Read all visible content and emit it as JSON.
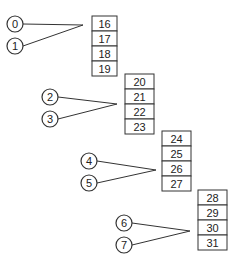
{
  "diagram": {
    "stroke_color": "#333333",
    "background": "#ffffff",
    "groups": [
      {
        "inputs": [
          {
            "label": "0",
            "cx": 15,
            "cy": 24
          },
          {
            "label": "1",
            "cx": 15,
            "cy": 46
          }
        ],
        "converge": {
          "x": 83,
          "y": 25
        },
        "box": {
          "x": 92,
          "y": 16,
          "w": 25,
          "cell_h": 15
        },
        "cells": [
          "16",
          "17",
          "18",
          "19"
        ]
      },
      {
        "inputs": [
          {
            "label": "2",
            "cx": 50,
            "cy": 97
          },
          {
            "label": "3",
            "cx": 50,
            "cy": 119
          }
        ],
        "converge": {
          "x": 117,
          "y": 104
        },
        "box": {
          "x": 125,
          "y": 74,
          "w": 29,
          "cell_h": 15
        },
        "cells": [
          "20",
          "21",
          "22",
          "23"
        ]
      },
      {
        "inputs": [
          {
            "label": "4",
            "cx": 89,
            "cy": 161
          },
          {
            "label": "5",
            "cx": 89,
            "cy": 183
          }
        ],
        "converge": {
          "x": 156,
          "y": 170
        },
        "box": {
          "x": 162,
          "y": 131,
          "w": 29,
          "cell_h": 15
        },
        "cells": [
          "24",
          "25",
          "26",
          "27"
        ]
      },
      {
        "inputs": [
          {
            "label": "6",
            "cx": 124,
            "cy": 223
          },
          {
            "label": "7",
            "cx": 124,
            "cy": 245
          }
        ],
        "converge": {
          "x": 190,
          "y": 231
        },
        "box": {
          "x": 198,
          "y": 190,
          "w": 29,
          "cell_h": 15
        },
        "cells": [
          "28",
          "29",
          "30",
          "31"
        ]
      }
    ]
  }
}
